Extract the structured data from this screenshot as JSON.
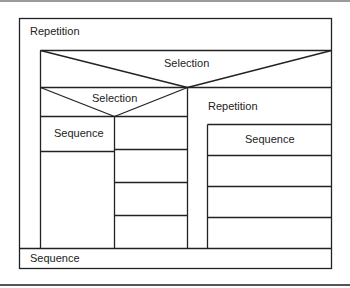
{
  "diagram": {
    "type": "nassi-shneiderman",
    "outer_repetition": {
      "label": "Repetition"
    },
    "top_selection": {
      "label": "Selection"
    },
    "left_branch": {
      "selection": {
        "label": "Selection"
      },
      "sequence": {
        "label": "Sequence"
      }
    },
    "right_branch": {
      "repetition": {
        "label": "Repetition"
      },
      "sequence": {
        "label": "Sequence"
      }
    },
    "bottom_sequence": {
      "label": "Sequence"
    }
  }
}
